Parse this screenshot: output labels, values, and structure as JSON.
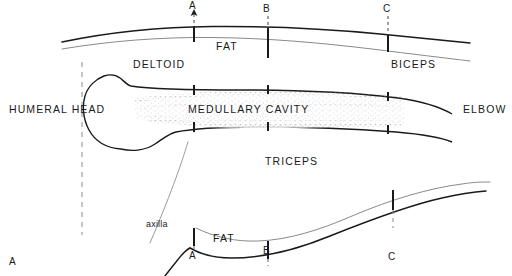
{
  "figure": {
    "type": "anatomical-schematic",
    "background_color": "#ffffff",
    "ink_color": "#1a1a1a",
    "light_ink_color": "#888888"
  },
  "labels": {
    "fat_upper": "FAT",
    "deltoid": "DELTOID",
    "biceps": "BICEPS",
    "humeral_head": "HUMERAL  HEAD",
    "medullary_cavity": "MEDULLARY  CAVITY",
    "elbow": "ELBOW",
    "triceps": "TRICEPS",
    "axilla": "axilla",
    "fat_lower": "FAT"
  },
  "markers": {
    "top": [
      {
        "letter": "A",
        "has_arrow": true
      },
      {
        "letter": "B",
        "has_arrow": false
      },
      {
        "letter": "C",
        "has_arrow": false
      }
    ],
    "bottom": [
      {
        "letter": "A"
      },
      {
        "letter": "B"
      },
      {
        "letter": "C"
      }
    ],
    "corner": {
      "letter": "A"
    }
  }
}
